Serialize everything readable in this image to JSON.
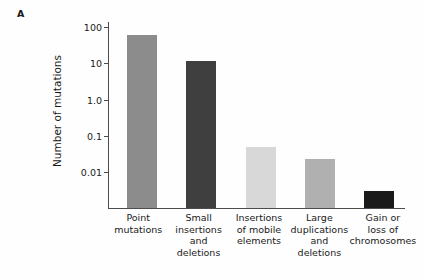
{
  "figure": {
    "panel_label": "A",
    "y_axis_title": "Number of mutations"
  },
  "chart_data": {
    "type": "bar",
    "title": "",
    "xlabel": "",
    "ylabel": "Number of mutations",
    "yscale": "log",
    "ylim": [
      0.002,
      130
    ],
    "grid": false,
    "legend": "none",
    "categories": [
      "Point mutations",
      "Small insertions and deletions",
      "Insertions of mobile elements",
      "Large duplications and deletions",
      "Gain or loss of chromosomes"
    ],
    "category_lines": [
      [
        "Point",
        "mutations"
      ],
      [
        "Small",
        "insertions",
        "and",
        "deletions"
      ],
      [
        "Insertions",
        "of mobile",
        "elements"
      ],
      [
        "Large",
        "duplications",
        "and",
        "deletions"
      ],
      [
        "Gain or",
        "loss of",
        "chromosomes"
      ]
    ],
    "values": [
      60,
      11.5,
      0.05,
      0.023,
      0.003
    ],
    "bar_colors": [
      "#8c8c8c",
      "#3f3f3f",
      "#d8d8d8",
      "#b0b0b0",
      "#1a1a1a"
    ],
    "y_ticks": [
      100,
      10,
      1.0,
      0.1,
      0.01
    ],
    "y_tick_labels": [
      "100",
      "10",
      "1.0",
      "0.1",
      "0.01"
    ],
    "axis_color": "#4d4d4d"
  }
}
